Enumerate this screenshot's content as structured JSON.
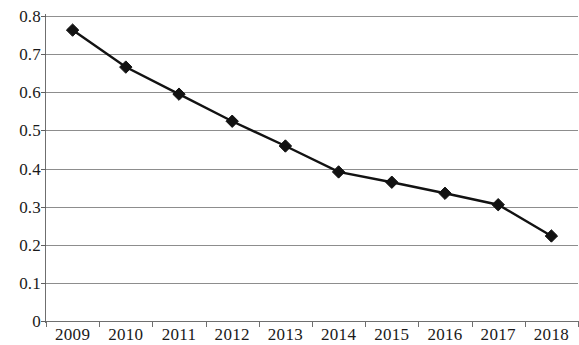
{
  "chart_data": {
    "type": "line",
    "title": "",
    "xlabel": "",
    "ylabel": "",
    "categories": [
      "2009",
      "2010",
      "2011",
      "2012",
      "2013",
      "2014",
      "2015",
      "2016",
      "2017",
      "2018"
    ],
    "values": [
      0.763,
      0.666,
      0.595,
      0.524,
      0.459,
      0.391,
      0.364,
      0.335,
      0.305,
      0.223
    ],
    "series": [
      {
        "name": "",
        "values": [
          0.763,
          0.666,
          0.595,
          0.524,
          0.459,
          0.391,
          0.364,
          0.335,
          0.305,
          0.223
        ]
      }
    ],
    "ylim": [
      0,
      0.8
    ],
    "ytick_labels": [
      "0.8",
      "0.7",
      "0.6",
      "0.5",
      "0.4",
      "0.3",
      "0.2",
      "0.1",
      "0"
    ],
    "ytick_values": [
      0.8,
      0.7,
      0.6,
      0.5,
      0.4,
      0.3,
      0.2,
      0.1,
      0
    ],
    "xtick_labels": [
      "2009",
      "2010",
      "2011",
      "2012",
      "2013",
      "2014",
      "2015",
      "2016",
      "2017",
      "2018"
    ],
    "grid": "horizontal",
    "legend": "none",
    "marker": "diamond",
    "line_color": "#121212",
    "marker_color": "#121212",
    "gridline_color": "#8d8d8d",
    "axis_color": "#6f6f6f",
    "background_color": "#ffffff"
  }
}
